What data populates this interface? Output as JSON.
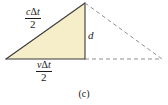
{
  "figure": {
    "caption": "(c)",
    "background_color": "#ffffff",
    "triangle_fill_color": "#f5eec8",
    "triangle_stroke_color": "#3a3a3a",
    "dashed_stroke_color": "#8c8c8c",
    "text_color": "#1a1a1a",
    "labels": {
      "hypotenuse": {
        "numerator_var": "c",
        "numerator_delta": "Δ",
        "numerator_t": "t",
        "denominator": "2",
        "plain": "cΔt/2"
      },
      "base": {
        "numerator_var": "v",
        "numerator_delta": "Δ",
        "numerator_t": "t",
        "denominator": "2",
        "plain": "vΔt/2"
      },
      "height": {
        "text": "d"
      }
    },
    "geometry": {
      "solid_triangle": {
        "left_vertex": [
          6,
          59
        ],
        "apex": [
          85,
          3
        ],
        "right_vertex": [
          85,
          59
        ]
      },
      "dashed_triangle": {
        "apex": [
          85,
          3
        ],
        "right_vertex": [
          162,
          59
        ],
        "base_left": [
          85,
          59
        ]
      }
    }
  }
}
